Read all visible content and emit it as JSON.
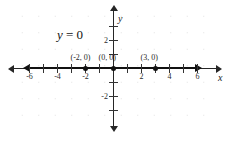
{
  "chart_data": {
    "type": "line",
    "title": "",
    "equation_label": "y = 0",
    "equation_var": "y",
    "equation_rest": " = 0",
    "xlabel": "x",
    "ylabel": "y",
    "xlim": [
      -7,
      7
    ],
    "ylim": [
      -4,
      4
    ],
    "grid": true,
    "grid_style": "dotted",
    "legend": "none",
    "x_ticks": [
      {
        "value": -6,
        "label": "-6"
      },
      {
        "value": -5,
        "label": ""
      },
      {
        "value": -4,
        "label": "-4"
      },
      {
        "value": -3,
        "label": ""
      },
      {
        "value": -2,
        "label": "-2"
      },
      {
        "value": -1,
        "label": ""
      },
      {
        "value": 1,
        "label": ""
      },
      {
        "value": 2,
        "label": "2"
      },
      {
        "value": 3,
        "label": ""
      },
      {
        "value": 4,
        "label": "4"
      },
      {
        "value": 5,
        "label": ""
      },
      {
        "value": 6,
        "label": "6"
      }
    ],
    "y_ticks": [
      {
        "value": 3,
        "label": ""
      },
      {
        "value": 2,
        "label": "2"
      },
      {
        "value": 1,
        "label": ""
      },
      {
        "value": -1,
        "label": ""
      },
      {
        "value": -2,
        "label": "-2"
      },
      {
        "value": -3,
        "label": ""
      }
    ],
    "series": [
      {
        "name": "y = 0",
        "kind": "horizontal-line",
        "y": 0,
        "x_from": -5,
        "x_to": 5,
        "arrows": "both",
        "color": "#111111"
      }
    ],
    "points": [
      {
        "x": -2,
        "y": 0,
        "label": "(-2, 0)"
      },
      {
        "x": 0,
        "y": 0,
        "label": "(0, 0)"
      },
      {
        "x": 3,
        "y": 0,
        "label": "(3, 0)"
      }
    ],
    "colors": {
      "axis": "#262626",
      "line": "#111111",
      "point": "#111111",
      "grid": "#c9c9c9",
      "text": "#1f1f1f",
      "background": "#ffffff"
    }
  }
}
